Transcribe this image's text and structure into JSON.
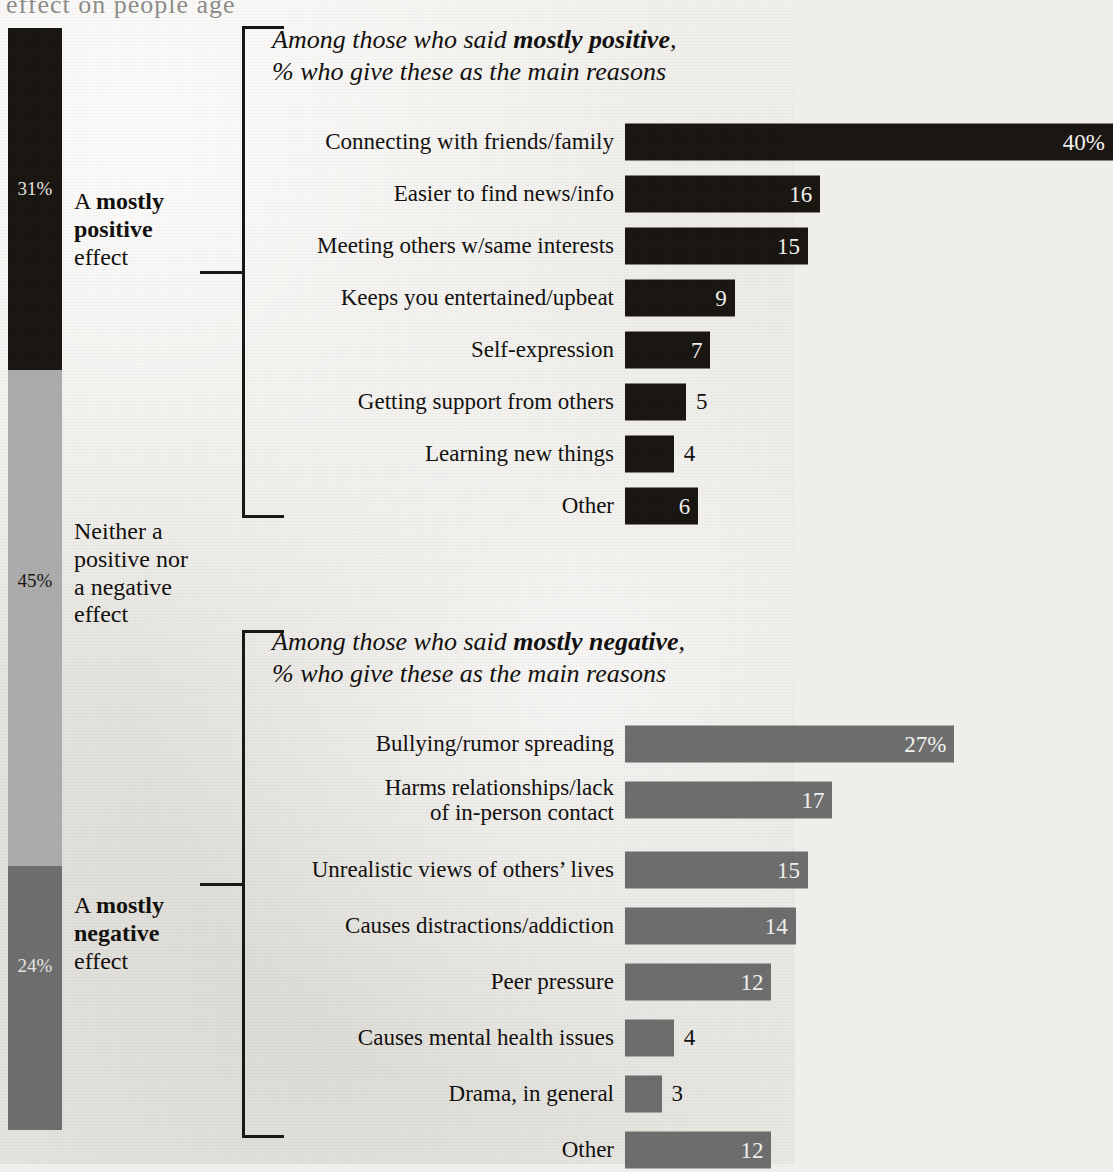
{
  "page": {
    "background_color": "#ece9e4",
    "cropped_top_text": "effect on people age"
  },
  "stacked_bar": {
    "name": "effect-of-social-media-stacked-bar",
    "segments": [
      {
        "key": "positive",
        "percent_label": "31%",
        "value": 31,
        "color": "#1a1713",
        "label_color": "#e9e7e2",
        "text_lines": [
          "A ",
          "mostly",
          "positive",
          " effect"
        ],
        "text_html_plain": "A mostly positive effect"
      },
      {
        "key": "neither",
        "percent_label": "45%",
        "value": 45,
        "color": "#adadad",
        "label_color": "#1a1713",
        "text_html_plain": "Neither a positive nor a negative effect"
      },
      {
        "key": "negative",
        "percent_label": "24%",
        "value": 24,
        "color": "#6f6f6f",
        "label_color": "#e9e7e2",
        "text_html_plain": "A mostly negative effect"
      }
    ]
  },
  "chart_data": [
    {
      "type": "bar",
      "id": "positive-reasons",
      "title": "Among those who said mostly positive, % who give these as the main reasons",
      "title_lead": "Among those who said ",
      "title_bold": "mostly positive",
      "title_tail": ",",
      "title_line2": "% who give these as the main reasons",
      "orientation": "horizontal",
      "bar_color": "#1a1713",
      "xlabel": "",
      "ylabel": "",
      "xlim": [
        0,
        40
      ],
      "grid": false,
      "legend": false,
      "categories": [
        "Connecting with friends/family",
        "Easier to find news/info",
        "Meeting others w/same interests",
        "Keeps you entertained/upbeat",
        "Self-expression",
        "Getting support from others",
        "Learning new things",
        "Other"
      ],
      "values": [
        40,
        16,
        15,
        9,
        7,
        5,
        4,
        6
      ],
      "value_labels": [
        "40%",
        "16",
        "15",
        "9",
        "7",
        "5",
        "4",
        "6"
      ],
      "label_inside": [
        true,
        true,
        true,
        true,
        true,
        false,
        false,
        true
      ]
    },
    {
      "type": "bar",
      "id": "negative-reasons",
      "title": "Among those who said mostly negative, % who give these as the main reasons",
      "title_lead": "Among those who said ",
      "title_bold": "mostly negative",
      "title_tail": ",",
      "title_line2": "% who give these as the main reasons",
      "orientation": "horizontal",
      "bar_color": "#6e6e6e",
      "xlabel": "",
      "ylabel": "",
      "xlim": [
        0,
        40
      ],
      "grid": false,
      "legend": false,
      "categories": [
        "Bullying/rumor spreading",
        "Harms relationships/lack\nof in-person contact",
        "Unrealistic views of others’ lives",
        "Causes distractions/addiction",
        "Peer pressure",
        "Causes mental health issues",
        "Drama, in general",
        "Other"
      ],
      "values": [
        27,
        17,
        15,
        14,
        12,
        4,
        3,
        12
      ],
      "value_labels": [
        "27%",
        "17",
        "15",
        "14",
        "12",
        "4",
        "3",
        "12"
      ],
      "label_inside": [
        true,
        true,
        true,
        true,
        true,
        false,
        false,
        true
      ]
    }
  ]
}
